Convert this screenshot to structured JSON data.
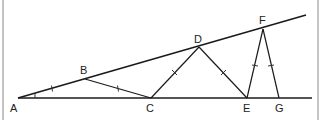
{
  "diagram": {
    "type": "geometry-figure",
    "colors": {
      "stroke": "#1a1a1a",
      "tick": "#333333",
      "background": "#ffffff",
      "border": "#888888"
    },
    "points": {
      "A": {
        "label": "A",
        "x": 18,
        "y": 98
      },
      "B": {
        "label": "B",
        "x": 85,
        "y": 79
      },
      "C": {
        "label": "C",
        "x": 151,
        "y": 98
      },
      "D": {
        "label": "D",
        "x": 199,
        "y": 47
      },
      "E": {
        "label": "E",
        "x": 247,
        "y": 98
      },
      "F": {
        "label": "F",
        "x": 263,
        "y": 29
      },
      "G": {
        "label": "G",
        "x": 279,
        "y": 98
      }
    },
    "labels": [
      "A",
      "B",
      "C",
      "D",
      "E",
      "F",
      "G"
    ],
    "equal_segments": [
      "AB",
      "BC",
      "CD",
      "DE",
      "EF",
      "FG"
    ],
    "angle_mark": "A"
  }
}
